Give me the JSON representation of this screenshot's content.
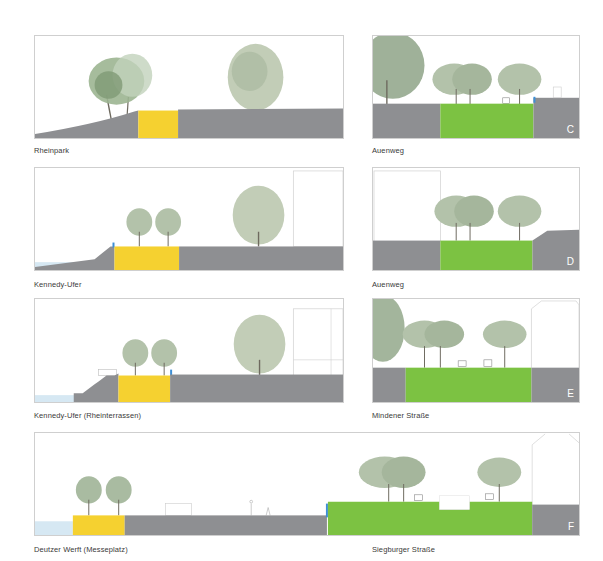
{
  "colors": {
    "ground": "#8e8f92",
    "yellow": "#f5d130",
    "green": "#7cc242",
    "water": "#d6e8f3",
    "accent_blue": "#3d8fd6",
    "border": "#cfcfcf",
    "caption_text": "#3a3a3a",
    "tree_foliage": "#a9bba1",
    "tree_foliage_dark": "#8fa487"
  },
  "sections": [
    {
      "id": "rheinpark",
      "caption": "Rheinpark",
      "letter": "",
      "side": "left",
      "surface": "yellow"
    },
    {
      "id": "auenweg-c",
      "caption": "Auenweg",
      "letter": "C",
      "side": "right",
      "surface": "green"
    },
    {
      "id": "kennedy-ufer",
      "caption": "Kennedy-Ufer",
      "letter": "",
      "side": "left",
      "surface": "yellow"
    },
    {
      "id": "auenweg-d",
      "caption": "Auenweg",
      "letter": "D",
      "side": "right",
      "surface": "green"
    },
    {
      "id": "kennedy-ufer-rheinterrassen",
      "caption": "Kennedy-Ufer (Rheinterrassen)",
      "letter": "",
      "side": "left",
      "surface": "yellow"
    },
    {
      "id": "mindener-strasse",
      "caption": "Mindener Straße",
      "letter": "E",
      "side": "right",
      "surface": "green"
    },
    {
      "id": "deutzer-werft",
      "caption": "Deutzer Werft (Messeplatz)",
      "letter": "",
      "side": "wide-left",
      "surface": "yellow"
    },
    {
      "id": "siegburger-strasse",
      "caption": "Siegburger Straße",
      "letter": "F",
      "side": "wide-right",
      "surface": "green"
    }
  ]
}
